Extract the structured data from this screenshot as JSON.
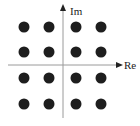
{
  "diagram": {
    "type": "constellation",
    "axes": {
      "x_label": "Re",
      "y_label": "Im"
    },
    "colors": {
      "axis": "#9a9a9a",
      "arrow": "#222222",
      "point": "#1e1e1e",
      "background": "#ffffff"
    },
    "points": [
      {
        "i": -3,
        "q": 3
      },
      {
        "i": -1,
        "q": 3
      },
      {
        "i": 1,
        "q": 3
      },
      {
        "i": 3,
        "q": 3
      },
      {
        "i": -3,
        "q": 1
      },
      {
        "i": -1,
        "q": 1
      },
      {
        "i": 1,
        "q": 1
      },
      {
        "i": 3,
        "q": 1
      },
      {
        "i": -3,
        "q": -1
      },
      {
        "i": -1,
        "q": -1
      },
      {
        "i": 1,
        "q": -1
      },
      {
        "i": 3,
        "q": -1
      },
      {
        "i": -3,
        "q": -3
      },
      {
        "i": -1,
        "q": -3
      },
      {
        "i": 1,
        "q": -3
      },
      {
        "i": 3,
        "q": -3
      }
    ]
  }
}
